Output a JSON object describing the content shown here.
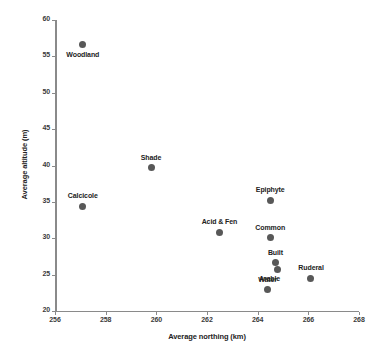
{
  "chart_data": {
    "type": "scatter",
    "title": "",
    "xlabel": "Average northing (km)",
    "ylabel": "Average altitude (m)",
    "xlim": [
      256,
      268
    ],
    "ylim": [
      20,
      60
    ],
    "xticks": [
      256,
      258,
      260,
      262,
      264,
      266,
      268
    ],
    "yticks": [
      20,
      25,
      30,
      35,
      40,
      45,
      50,
      55,
      60
    ],
    "grid": false,
    "legend": "none",
    "point_color": "#585858",
    "axis_color": "#8a8a8a",
    "points": [
      {
        "label": "Woodland",
        "x": 257.1,
        "y": 56.6,
        "label_pos": "below"
      },
      {
        "label": "Shade",
        "x": 259.8,
        "y": 39.7,
        "label_pos": "above"
      },
      {
        "label": "Calcicole",
        "x": 257.1,
        "y": 34.4,
        "label_pos": "above"
      },
      {
        "label": "Epiphyte",
        "x": 264.5,
        "y": 35.2,
        "label_pos": "above"
      },
      {
        "label": "Acid & Fen",
        "x": 262.5,
        "y": 30.8,
        "label_pos": "above"
      },
      {
        "label": "Common",
        "x": 264.5,
        "y": 30.1,
        "label_pos": "above"
      },
      {
        "label": "Built",
        "x": 264.7,
        "y": 26.6,
        "label_pos": "above"
      },
      {
        "label": "Arable",
        "x": 264.8,
        "y": 25.7,
        "label_pos": "below-left"
      },
      {
        "label": "Ruderal",
        "x": 266.1,
        "y": 24.5,
        "label_pos": "above"
      },
      {
        "label": "Water",
        "x": 264.4,
        "y": 22.9,
        "label_pos": "above"
      }
    ]
  }
}
